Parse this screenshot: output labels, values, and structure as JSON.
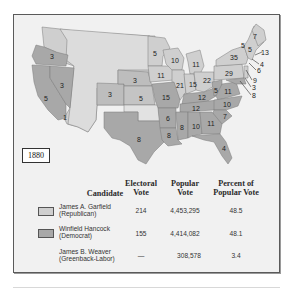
{
  "map": {
    "title": "Presidential Election of 1880",
    "year_label": "1880",
    "colors": {
      "republican": "#cfcfcf",
      "democrat": "#a8a8a8",
      "background": "#f1f1f1",
      "border": "#5a5a5a"
    },
    "state_labels": [
      {
        "id": "oregon",
        "value": "3",
        "x": 52,
        "y": 56,
        "party": "democrat"
      },
      {
        "id": "california",
        "value": "5",
        "x": 46,
        "y": 98,
        "party": "democrat"
      },
      {
        "id": "california-rep",
        "value": "1",
        "x": 65,
        "y": 117,
        "party": "republican"
      },
      {
        "id": "nevada",
        "value": "3",
        "x": 62,
        "y": 85,
        "party": "democrat"
      },
      {
        "id": "colorado",
        "value": "3",
        "x": 110,
        "y": 94,
        "party": "republican"
      },
      {
        "id": "nebraska",
        "value": "3",
        "x": 135,
        "y": 80,
        "party": "republican"
      },
      {
        "id": "kansas",
        "value": "5",
        "x": 141,
        "y": 98,
        "party": "republican"
      },
      {
        "id": "texas",
        "value": "8",
        "x": 139,
        "y": 139,
        "party": "democrat"
      },
      {
        "id": "minnesota",
        "value": "5",
        "x": 155,
        "y": 53,
        "party": "republican"
      },
      {
        "id": "wisconsin",
        "value": "10",
        "x": 175,
        "y": 60,
        "party": "republican"
      },
      {
        "id": "iowa",
        "value": "11",
        "x": 161,
        "y": 75,
        "party": "republican"
      },
      {
        "id": "michigan",
        "value": "11",
        "x": 196,
        "y": 64,
        "party": "republican"
      },
      {
        "id": "illinois",
        "value": "21",
        "x": 180,
        "y": 85,
        "party": "republican"
      },
      {
        "id": "indiana",
        "value": "15",
        "x": 193,
        "y": 84,
        "party": "republican"
      },
      {
        "id": "ohio",
        "value": "22",
        "x": 207,
        "y": 80,
        "party": "republican"
      },
      {
        "id": "missouri",
        "value": "15",
        "x": 166,
        "y": 97,
        "party": "democrat"
      },
      {
        "id": "kentucky",
        "value": "12",
        "x": 202,
        "y": 97,
        "party": "democrat"
      },
      {
        "id": "west-virginia",
        "value": "5",
        "x": 216,
        "y": 90,
        "party": "democrat"
      },
      {
        "id": "virginia",
        "value": "11",
        "x": 228,
        "y": 91,
        "party": "democrat"
      },
      {
        "id": "tennessee",
        "value": "12",
        "x": 196,
        "y": 108,
        "party": "democrat"
      },
      {
        "id": "north-carolina",
        "value": "10",
        "x": 227,
        "y": 104,
        "party": "democrat"
      },
      {
        "id": "south-carolina",
        "value": "7",
        "x": 225,
        "y": 116,
        "party": "democrat"
      },
      {
        "id": "arkansas",
        "value": "6",
        "x": 168,
        "y": 118,
        "party": "democrat"
      },
      {
        "id": "louisiana",
        "value": "8",
        "x": 169,
        "y": 135,
        "party": "democrat"
      },
      {
        "id": "mississippi",
        "value": "8",
        "x": 182,
        "y": 127,
        "party": "democrat"
      },
      {
        "id": "alabama",
        "value": "10",
        "x": 196,
        "y": 126,
        "party": "democrat"
      },
      {
        "id": "georgia",
        "value": "11",
        "x": 211,
        "y": 123,
        "party": "democrat"
      },
      {
        "id": "florida",
        "value": "4",
        "x": 224,
        "y": 148,
        "party": "democrat"
      },
      {
        "id": "pennsylvania",
        "value": "29",
        "x": 229,
        "y": 73,
        "party": "republican"
      },
      {
        "id": "new-york",
        "value": "35",
        "x": 234,
        "y": 57,
        "party": "republican"
      },
      {
        "id": "vermont",
        "value": "5",
        "x": 243,
        "y": 45,
        "party": "republican"
      },
      {
        "id": "new-hampshire",
        "value": "5",
        "x": 250,
        "y": 49,
        "party": "republican"
      },
      {
        "id": "maine",
        "value": "7",
        "x": 255,
        "y": 36,
        "party": "republican"
      }
    ],
    "callouts": [
      {
        "id": "massachusetts",
        "value": "13",
        "x": 265,
        "y": 52
      },
      {
        "id": "rhode-island",
        "value": "4",
        "x": 262,
        "y": 64
      },
      {
        "id": "connecticut",
        "value": "6",
        "x": 259,
        "y": 70
      },
      {
        "id": "new-jersey",
        "value": "9",
        "x": 255,
        "y": 80
      },
      {
        "id": "delaware",
        "value": "3",
        "x": 254,
        "y": 87
      },
      {
        "id": "maryland",
        "value": "8",
        "x": 254,
        "y": 95
      }
    ]
  },
  "table": {
    "headers": {
      "candidate": "Candidate",
      "electoral_1": "Electoral",
      "electoral_2": "Vote",
      "popular_1": "Popular",
      "popular_2": "Vote",
      "percent_1": "Percent of",
      "percent_2": "Popular Vote"
    },
    "rows": [
      {
        "name": "James A. Garfield",
        "party": "(Republican)",
        "electoral": "214",
        "popular": "4,453,295",
        "percent": "48.5",
        "swatch": "#cfcfcf"
      },
      {
        "name": "Winfield Hancock",
        "party": "(Democrat)",
        "electoral": "155",
        "popular": "4,414,082",
        "percent": "48.1",
        "swatch": "#a8a8a8"
      },
      {
        "name": "James B. Weaver",
        "party": "(Greenback-Labor)",
        "electoral": "—",
        "popular": "308,578",
        "percent": "3.4",
        "swatch": null
      }
    ]
  }
}
